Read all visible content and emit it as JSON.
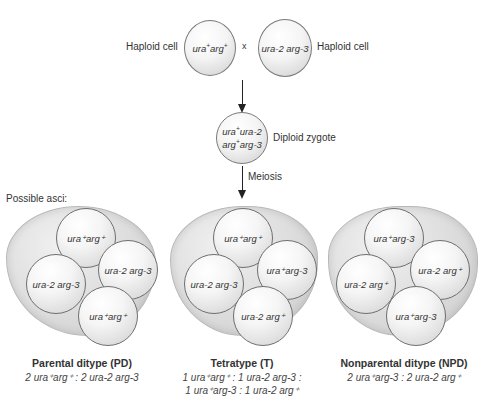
{
  "cross": {
    "left_label": "Haploid cell",
    "right_label": "Haploid cell",
    "times_symbol": "x",
    "parent1": {
      "gene1": "ura",
      "gene1_sup": "+",
      "gene2": "arg",
      "gene2_sup": "+"
    },
    "parent2": {
      "text": "ura-2 arg-3"
    }
  },
  "zygote": {
    "label": "Diploid zygote",
    "line1": {
      "a": "ura",
      "a_sup": "+",
      "b": "ura-2"
    },
    "line2": {
      "a": "arg",
      "a_sup": "+",
      "b": "arg-3"
    }
  },
  "meiosis_label": "Meiosis",
  "asci_heading": "Possible asci:",
  "asci": [
    {
      "title": "Parental ditype (PD)",
      "ratio_lines": [
        "2 ura⁺arg⁺ : 2 ura-2 arg-3"
      ],
      "spores": [
        "ura⁺arg⁺",
        "ura-2 arg-3",
        "ura-2 arg-3",
        "ura⁺arg⁺"
      ]
    },
    {
      "title": "Tetratype (T)",
      "ratio_lines": [
        "1 ura⁺arg⁺ : 1 ura-2 arg-3 :",
        "1 ura⁺arg-3 : 1 ura-2 arg⁺"
      ],
      "spores": [
        "ura⁺arg⁺",
        "ura⁺arg-3",
        "ura-2 arg-3",
        "ura-2 arg⁺"
      ]
    },
    {
      "title": "Nonparental ditype (NPD)",
      "ratio_lines": [
        "2 ura⁺arg-3 : 2 ura-2 arg⁺"
      ],
      "spores": [
        "ura⁺arg-3",
        "ura-2 arg⁺",
        "ura-2 arg⁺",
        "ura⁺arg-3"
      ]
    }
  ],
  "colors": {
    "cell_border": "#7a7a7a",
    "ascus_fill": "#d9d9d9",
    "text": "#333333",
    "arrow": "#222222"
  }
}
